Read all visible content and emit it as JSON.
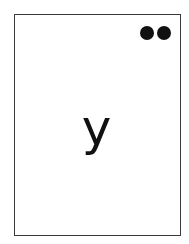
{
  "card": {
    "letter": "y",
    "dot_count": 2,
    "dot_color": "#111111",
    "border_color": "#3a3a3a"
  }
}
